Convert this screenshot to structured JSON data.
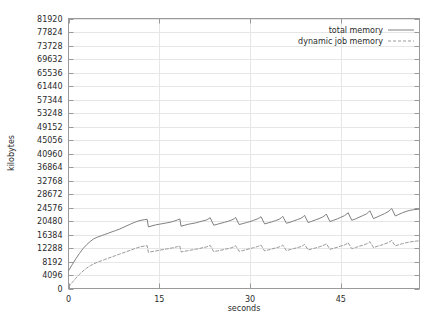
{
  "chart_data": {
    "type": "line",
    "title": "",
    "xlabel": "seconds",
    "ylabel": "kilobytes",
    "xlim": [
      0,
      58
    ],
    "ylim": [
      0,
      81920
    ],
    "grid": true,
    "legend_position": "top-right",
    "xticks": [
      0,
      15,
      30,
      45
    ],
    "xtick_labels": [
      "0",
      "15",
      "30",
      "45"
    ],
    "yticks": [
      0,
      4096,
      8192,
      12288,
      16384,
      20480,
      24576,
      28672,
      32768,
      36864,
      40960,
      45056,
      49152,
      53248,
      57344,
      61440,
      65536,
      69632,
      73728,
      77824,
      81920
    ],
    "ytick_labels": [
      "0",
      "4096",
      "8192",
      "12288",
      "16384",
      "20480",
      "24576",
      "28672",
      "32768",
      "36864",
      "40960",
      "45056",
      "49152",
      "53248",
      "57344",
      "61440",
      "65536",
      "69632",
      "73728",
      "77824",
      "81920"
    ],
    "series": [
      {
        "name": "total memory",
        "style": "solid",
        "color": "#808080",
        "x": [
          0,
          0.6,
          1.2,
          1.8,
          2.4,
          3.0,
          3.6,
          4.2,
          4.8,
          5.4,
          6.0,
          6.6,
          7.2,
          7.8,
          8.4,
          9.0,
          9.6,
          10.2,
          10.8,
          11.4,
          12.0,
          12.6,
          13.0,
          13.2,
          13.8,
          14.4,
          15.0,
          15.6,
          16.2,
          16.8,
          17.4,
          18.0,
          18.4,
          18.6,
          19.2,
          19.8,
          20.4,
          21.0,
          21.6,
          22.2,
          22.8,
          23.2,
          23.4,
          24.0,
          24.6,
          25.2,
          25.8,
          26.4,
          27.0,
          27.4,
          27.6,
          28.2,
          28.8,
          29.4,
          30.0,
          30.6,
          31.2,
          31.6,
          31.8,
          32.4,
          33.0,
          33.6,
          34.2,
          34.8,
          35.2,
          35.4,
          36.0,
          36.6,
          37.2,
          37.8,
          38.4,
          38.8,
          39.0,
          39.6,
          40.2,
          40.8,
          41.4,
          42.0,
          42.4,
          42.6,
          43.2,
          43.8,
          44.4,
          45.0,
          45.6,
          46.0,
          46.2,
          46.8,
          47.4,
          48.0,
          48.6,
          49.2,
          49.6,
          49.8,
          50.4,
          51.0,
          51.6,
          52.2,
          52.8,
          53.2,
          53.4,
          54.0,
          54.6,
          55.2,
          55.8,
          56.4,
          57.0,
          57.6,
          58.0
        ],
        "y": [
          5400,
          7200,
          9000,
          10600,
          12100,
          13300,
          14300,
          15100,
          15600,
          16000,
          16400,
          16800,
          17200,
          17600,
          18000,
          18500,
          19000,
          19500,
          20000,
          20400,
          20700,
          20900,
          21000,
          18700,
          19000,
          19300,
          19500,
          19700,
          19900,
          20100,
          20400,
          20800,
          21100,
          18900,
          19200,
          19500,
          19700,
          19900,
          20200,
          20500,
          20800,
          21200,
          21500,
          19200,
          19500,
          19800,
          20100,
          20400,
          20800,
          21200,
          21600,
          19400,
          19700,
          20000,
          20300,
          20700,
          21100,
          21500,
          21800,
          19600,
          19900,
          20200,
          20600,
          21000,
          21500,
          21900,
          19800,
          20100,
          20500,
          20900,
          21300,
          21800,
          22200,
          20000,
          20400,
          20800,
          21200,
          21700,
          22200,
          22600,
          20300,
          20700,
          21100,
          21600,
          22100,
          22600,
          23000,
          20700,
          21100,
          21600,
          22100,
          22600,
          23200,
          23600,
          21200,
          21700,
          22200,
          22700,
          23300,
          23900,
          24300,
          22000,
          22500,
          23000,
          23400,
          23700,
          23900,
          24000,
          24100
        ]
      },
      {
        "name": "dynamic job memory",
        "style": "dashed",
        "color": "#9a9a9a",
        "x": [
          0,
          0.6,
          1.2,
          1.8,
          2.4,
          3.0,
          3.6,
          4.2,
          4.8,
          5.4,
          6.0,
          6.6,
          7.2,
          7.8,
          8.4,
          9.0,
          9.6,
          10.2,
          10.8,
          11.4,
          12.0,
          12.6,
          13.0,
          13.2,
          13.8,
          14.4,
          15.0,
          15.6,
          16.2,
          16.8,
          17.4,
          18.0,
          18.4,
          18.6,
          19.2,
          19.8,
          20.4,
          21.0,
          21.6,
          22.2,
          22.8,
          23.2,
          23.4,
          24.0,
          24.6,
          25.2,
          25.8,
          26.4,
          27.0,
          27.4,
          27.6,
          28.2,
          28.8,
          29.4,
          30.0,
          30.6,
          31.2,
          31.6,
          31.8,
          32.4,
          33.0,
          33.6,
          34.2,
          34.8,
          35.2,
          35.4,
          36.0,
          36.6,
          37.2,
          37.8,
          38.4,
          38.8,
          39.0,
          39.6,
          40.2,
          40.8,
          41.4,
          42.0,
          42.4,
          42.6,
          43.2,
          43.8,
          44.4,
          45.0,
          45.6,
          46.0,
          46.2,
          46.8,
          47.4,
          48.0,
          48.6,
          49.2,
          49.6,
          49.8,
          50.4,
          51.0,
          51.6,
          52.2,
          52.8,
          53.2,
          53.4,
          54.0,
          54.6,
          55.2,
          55.8,
          56.4,
          57.0,
          57.6,
          58.0
        ],
        "y": [
          500,
          1800,
          3100,
          4300,
          5300,
          6200,
          6900,
          7500,
          8000,
          8400,
          8800,
          9200,
          9600,
          10000,
          10400,
          10800,
          11200,
          11600,
          12000,
          12400,
          12700,
          12900,
          13000,
          11000,
          11200,
          11400,
          11600,
          11800,
          12000,
          12200,
          12400,
          12700,
          12900,
          11100,
          11300,
          11500,
          11700,
          11900,
          12100,
          12400,
          12600,
          12900,
          13100,
          11200,
          11400,
          11600,
          11900,
          12100,
          12400,
          12700,
          13000,
          11300,
          11500,
          11800,
          12100,
          12400,
          12700,
          13000,
          13200,
          11400,
          11700,
          12000,
          12300,
          12600,
          12900,
          13200,
          11500,
          11800,
          12100,
          12400,
          12700,
          13100,
          13400,
          11700,
          12000,
          12300,
          12600,
          13000,
          13300,
          13600,
          11900,
          12200,
          12500,
          12900,
          13200,
          13600,
          13900,
          12100,
          12400,
          12800,
          13100,
          13500,
          13900,
          14200,
          12400,
          12800,
          13100,
          13500,
          13900,
          14300,
          14600,
          12900,
          13300,
          13600,
          13900,
          14100,
          14300,
          14400,
          14500
        ]
      }
    ]
  },
  "legend": {
    "entries": [
      {
        "label": "total memory"
      },
      {
        "label": "dynamic job memory"
      }
    ]
  },
  "axes": {
    "x_title": "seconds",
    "y_title": "kilobytes"
  },
  "colors": {
    "background": "#ffffff",
    "plot_border": "#9a9a9a",
    "gridline": "#e6e6e6",
    "text": "#2b2b2b",
    "series_total": "#808080",
    "series_dynamic": "#9a9a9a"
  }
}
